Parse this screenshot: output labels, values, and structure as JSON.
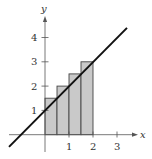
{
  "figure": {
    "colors": {
      "axis": "#555555",
      "line": "#111111",
      "rect_fill": "#c9c9c9",
      "rect_stroke": "#444444",
      "text": "#333333"
    },
    "axes": {
      "x_label": "x",
      "y_label": "y",
      "x_ticks": [
        "1",
        "2",
        "3"
      ],
      "y_ticks": [
        "1",
        "2",
        "3",
        "4"
      ]
    },
    "line": {
      "equation": "y = x + 1",
      "from": [
        -1.5,
        -0.5
      ],
      "to": [
        3.4,
        4.4
      ]
    },
    "rectangles": [
      {
        "x0": 0,
        "x1": 0.5,
        "height": 1.5
      },
      {
        "x0": 0.5,
        "x1": 1,
        "height": 2
      },
      {
        "x0": 1,
        "x1": 1.5,
        "height": 2.5
      },
      {
        "x0": 1.5,
        "x1": 2,
        "height": 3
      }
    ]
  }
}
